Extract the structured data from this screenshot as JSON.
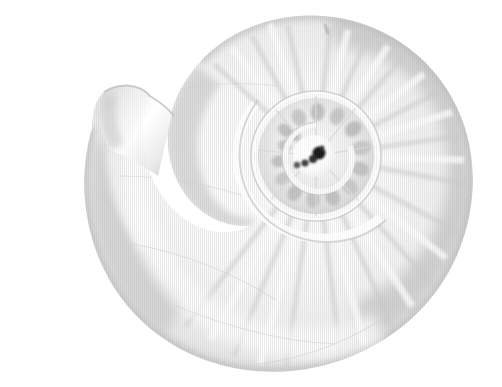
{
  "image": {
    "subject": "nautilus-shell",
    "alt_text": "Grayscale photograph of a sectioned nautilus shell forming a logarithmic spiral",
    "background_color": "#ffffff",
    "width": 502,
    "height": 387,
    "orientation": "spiral coiling counter-clockwise, aperture opening toward upper-left"
  },
  "palette": {
    "background": "#ffffff",
    "shell_light": "#fbfbfb",
    "shell_mid": "#e6e6e6",
    "shell_shadow": "#c9c9c9",
    "shell_edge": "#b4b4b4",
    "rib_tone": "#dcdcdc",
    "inner_whorl_blotch": "#bdbdbd",
    "nucleus_dark": "#1a1a1a",
    "highlight": "#ffffff"
  },
  "geometry": {
    "spiral_center_x": 316,
    "spiral_center_y": 156,
    "outer_whorl_right_x": 472,
    "outer_whorl_top_y": 22,
    "outer_whorl_bottom_y": 362,
    "aperture_x": 92,
    "aperture_y": 128,
    "inner_whorl_radius": 62,
    "nucleus_radius": 9
  },
  "features": [
    {
      "name": "body-whorl",
      "label": "Body whorl"
    },
    {
      "name": "aperture",
      "label": "Aperture"
    },
    {
      "name": "inner-whorl",
      "label": "Inner whorl"
    },
    {
      "name": "nucleus",
      "label": "Nucleus"
    },
    {
      "name": "radial-ribs",
      "label": "Radial ribs"
    },
    {
      "name": "suture-groove",
      "label": "Suture groove"
    }
  ],
  "inner_blotches": [
    {
      "angle": -88,
      "r": 44,
      "rx": 7,
      "ry": 9,
      "tone": "#b8b8b8"
    },
    {
      "angle": -62,
      "r": 45,
      "rx": 7,
      "ry": 9,
      "tone": "#bfbfbf"
    },
    {
      "angle": -36,
      "r": 46,
      "rx": 7,
      "ry": 9,
      "tone": "#b5b5b5"
    },
    {
      "angle": -10,
      "r": 46,
      "rx": 7,
      "ry": 10,
      "tone": "#c2c2c2"
    },
    {
      "angle": 16,
      "r": 46,
      "rx": 7,
      "ry": 9,
      "tone": "#bcbcbc"
    },
    {
      "angle": 42,
      "r": 45,
      "rx": 7,
      "ry": 9,
      "tone": "#c4c4c4"
    },
    {
      "angle": 68,
      "r": 44,
      "rx": 7,
      "ry": 9,
      "tone": "#bababa"
    },
    {
      "angle": 94,
      "r": 43,
      "rx": 7,
      "ry": 9,
      "tone": "#c0c0c0"
    },
    {
      "angle": 120,
      "r": 42,
      "rx": 7,
      "ry": 9,
      "tone": "#b9b9b9"
    },
    {
      "angle": 146,
      "r": 40,
      "rx": 6,
      "ry": 8,
      "tone": "#c3c3c3"
    },
    {
      "angle": 172,
      "r": 37,
      "rx": 6,
      "ry": 8,
      "tone": "#b6b6b6"
    },
    {
      "angle": 198,
      "r": 33,
      "rx": 6,
      "ry": 7,
      "tone": "#bdbdbd"
    },
    {
      "angle": 224,
      "r": 29,
      "rx": 5,
      "ry": 6,
      "tone": "#b2b2b2"
    },
    {
      "angle": -114,
      "r": 42,
      "rx": 7,
      "ry": 9,
      "tone": "#c1c1c1"
    },
    {
      "angle": -140,
      "r": 40,
      "rx": 6,
      "ry": 8,
      "tone": "#b7b7b7"
    }
  ],
  "nucleus_dots": [
    {
      "cx": 319,
      "cy": 153,
      "r": 6.5,
      "tone": "#171717"
    },
    {
      "cx": 313,
      "cy": 159,
      "r": 4.0,
      "tone": "#2b2b2b"
    },
    {
      "cx": 305,
      "cy": 163,
      "r": 3.6,
      "tone": "#3d3d3d"
    },
    {
      "cx": 297,
      "cy": 165,
      "r": 3.2,
      "tone": "#555555"
    },
    {
      "cx": 322,
      "cy": 148,
      "r": 2.4,
      "tone": "#333333"
    }
  ],
  "accessibility": {
    "role": "image",
    "description": "Nautilus shell spiral, grayscale, white background"
  }
}
